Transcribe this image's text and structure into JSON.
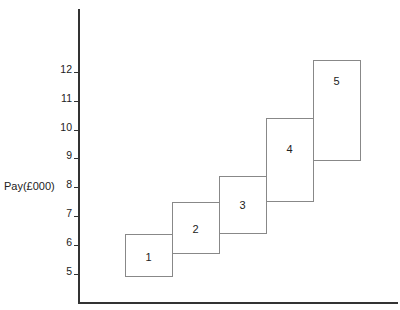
{
  "chart_data": {
    "type": "floating-bar",
    "title": "",
    "xlabel": "",
    "ylabel": "Pay(£000)",
    "yticks": [
      5,
      6,
      7,
      8,
      9,
      10,
      11,
      12
    ],
    "ylim": [
      4,
      13.5
    ],
    "grid": false,
    "legend": null,
    "categories": [
      "1",
      "2",
      "3",
      "4",
      "5"
    ],
    "series": [
      {
        "name": "pay_range",
        "values": [
          {
            "label": "1",
            "min": 4.9,
            "max": 6.4
          },
          {
            "label": "2",
            "min": 5.7,
            "max": 7.5
          },
          {
            "label": "3",
            "min": 6.4,
            "max": 8.4
          },
          {
            "label": "4",
            "min": 7.5,
            "max": 10.4
          },
          {
            "label": "5",
            "min": 8.9,
            "max": 12.4
          }
        ]
      }
    ]
  }
}
